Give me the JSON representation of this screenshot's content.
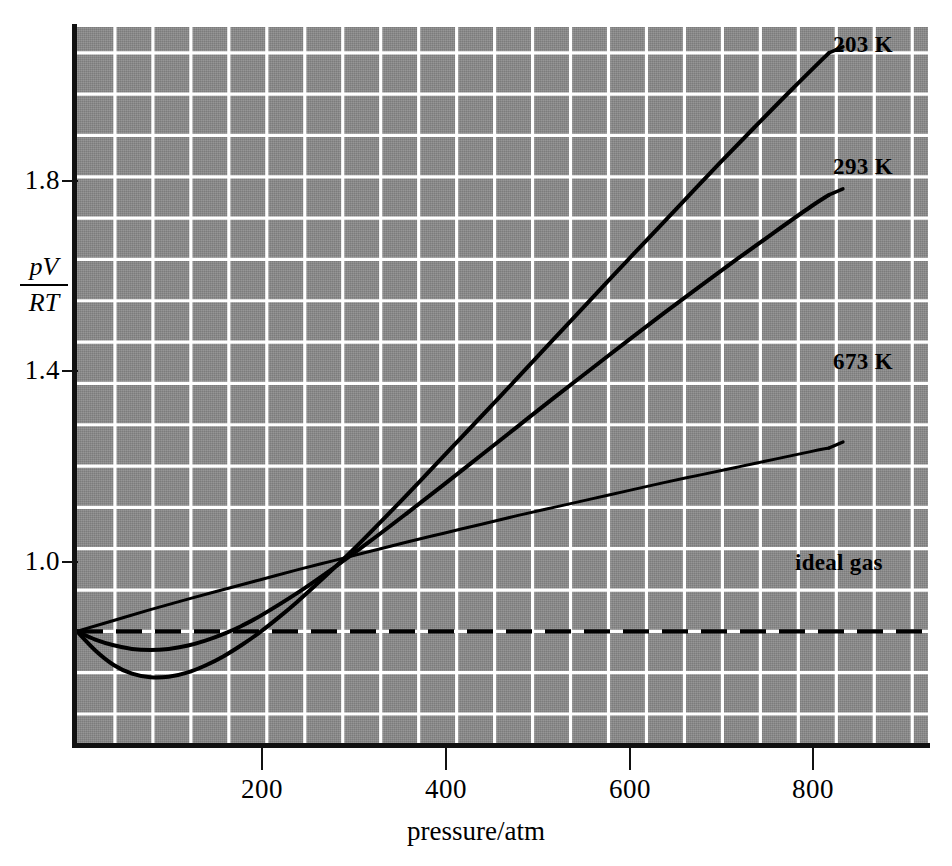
{
  "chart_data": {
    "type": "line",
    "title": "",
    "subtitle": "",
    "xlabel": "pressure/atm",
    "ylabel": "pV/RT",
    "ylabel_numerator": "pV",
    "ylabel_denominator": "RT",
    "xlim": [
      0,
      928
    ],
    "ylim": [
      0.78,
      2.17
    ],
    "xticks": [
      200,
      400,
      600,
      800
    ],
    "xticklabels": [
      "200",
      "400",
      "600",
      "800"
    ],
    "yticks": [
      1.0,
      1.4,
      1.8
    ],
    "yticklabels": [
      "1.0",
      "1.4",
      "1.8"
    ],
    "grid": true,
    "grid_color": "#ffffff",
    "grid_x_step_atm": 41.4,
    "grid_y_step_units": 0.08,
    "plot_background": "#8a8a8a",
    "line_color": "#000000",
    "legend_position": "inline-right-of-curve-ends",
    "annotations": [
      {
        "text": "203 K",
        "x_atm": 830,
        "y_value": 2.12
      },
      {
        "text": "293 K",
        "x_atm": 830,
        "y_value": 1.84
      },
      {
        "text": "673 K",
        "x_atm": 830,
        "y_value": 1.43
      },
      {
        "text": "ideal gas",
        "x_atm": 790,
        "y_value": 1.0
      }
    ],
    "reference_line": {
      "name": "ideal gas",
      "label": "ideal gas",
      "y_value": 1.0,
      "style": "dashed"
    },
    "series": [
      {
        "name": "203 K",
        "label": "203 K",
        "x": [
          0,
          20,
          40,
          60,
          80,
          100,
          120,
          140,
          160,
          180,
          200,
          220,
          240,
          260,
          280,
          300,
          340,
          380,
          420,
          460,
          500,
          540,
          580,
          620,
          660,
          700,
          740,
          780,
          820
        ],
        "y": [
          1.0,
          0.963,
          0.935,
          0.918,
          0.911,
          0.912,
          0.92,
          0.934,
          0.952,
          0.974,
          0.999,
          1.027,
          1.057,
          1.089,
          1.122,
          1.156,
          1.228,
          1.302,
          1.377,
          1.452,
          1.528,
          1.604,
          1.68,
          1.755,
          1.83,
          1.905,
          1.978,
          2.05,
          2.12
        ],
        "min_x_atm": 90,
        "min_y": 0.911,
        "crosses_unity_at_atm": 201
      },
      {
        "name": "293 K",
        "label": "293 K",
        "x": [
          0,
          20,
          40,
          60,
          80,
          100,
          120,
          140,
          160,
          180,
          200,
          240,
          280,
          320,
          360,
          400,
          440,
          480,
          520,
          560,
          600,
          640,
          680,
          720,
          760,
          800,
          820
        ],
        "y": [
          1.0,
          0.984,
          0.973,
          0.966,
          0.964,
          0.966,
          0.972,
          0.982,
          0.995,
          1.011,
          1.03,
          1.074,
          1.123,
          1.175,
          1.229,
          1.284,
          1.34,
          1.396,
          1.452,
          1.507,
          1.562,
          1.616,
          1.669,
          1.721,
          1.772,
          1.822,
          1.845
        ],
        "min_x_atm": 80,
        "min_y": 0.964,
        "crosses_unity_at_atm": 163
      },
      {
        "name": "673 K",
        "label": "673 K",
        "x": [
          0,
          40,
          80,
          120,
          160,
          200,
          240,
          280,
          320,
          360,
          400,
          440,
          480,
          520,
          560,
          600,
          640,
          680,
          720,
          760,
          800,
          820
        ],
        "y": [
          1.0,
          1.021,
          1.042,
          1.062,
          1.081,
          1.1,
          1.119,
          1.137,
          1.155,
          1.173,
          1.19,
          1.207,
          1.224,
          1.24,
          1.256,
          1.272,
          1.288,
          1.303,
          1.318,
          1.333,
          1.348,
          1.355
        ],
        "min_x_atm": 0,
        "min_y": 1.0,
        "crosses_unity_at_atm": 0
      }
    ]
  },
  "axes": {
    "y_label_parts": {
      "numerator": "pV",
      "denominator": "RT"
    },
    "x_title": "pressure/atm"
  }
}
